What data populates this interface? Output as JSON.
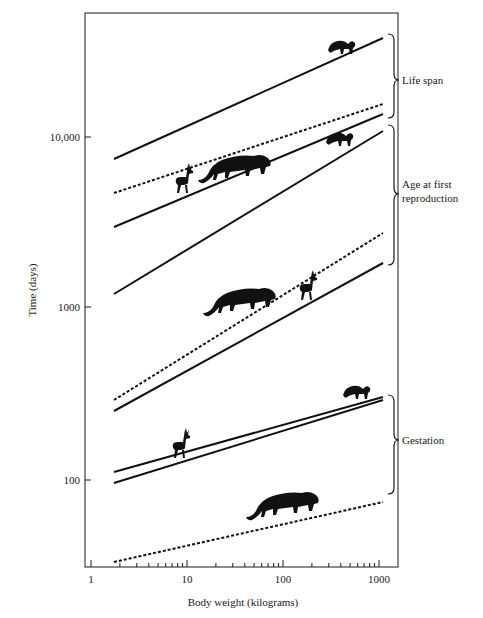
{
  "chart_data": {
    "type": "line",
    "title": "",
    "xlabel": "Body weight (kilograms)",
    "ylabel": "Time (days)",
    "xscale": "log",
    "yscale": "log",
    "xlim": [
      1,
      1300
    ],
    "ylim": [
      50,
      35000
    ],
    "x_ticks": [
      1,
      10,
      100,
      1000
    ],
    "x_tick_labels": [
      "1",
      "10",
      "100",
      "1000"
    ],
    "y_ticks": [
      100,
      1000,
      10000
    ],
    "y_tick_labels": [
      "100",
      "1000",
      "10,000"
    ],
    "grid": false,
    "legend": "none",
    "groups": [
      {
        "name": "Life span",
        "series_indices": [
          0,
          1
        ]
      },
      {
        "name": "Age at first reproduction",
        "series_indices": [
          2,
          3,
          4
        ]
      },
      {
        "name": "Gestation",
        "series_indices": [
          5,
          6,
          7
        ]
      }
    ],
    "series": [
      {
        "name": "Life span (primates)",
        "style": "solid",
        "x": [
          2.5,
          1000
        ],
        "y": [
          5500,
          28000
        ]
      },
      {
        "name": "Life span (carnivores)",
        "style": "dotted",
        "x": [
          2.5,
          1000
        ],
        "y": [
          3700,
          10500
        ]
      },
      {
        "name": "Age at first reproduction (ungulates)",
        "style": "solid",
        "x": [
          2.5,
          1000
        ],
        "y": [
          2550,
          9500
        ]
      },
      {
        "name": "Age at first reproduction (primates)",
        "style": "solid",
        "x": [
          2.5,
          1000
        ],
        "y": [
          1180,
          7900
        ]
      },
      {
        "name": "Age at first reproduction (carnivores)",
        "style": "dotted",
        "x": [
          2.5,
          1000
        ],
        "y": [
          350,
          2400
        ]
      },
      {
        "name": "Age at first reproduction (ungulates, lower)",
        "style": "solid",
        "x": [
          2.5,
          1000
        ],
        "y": [
          310,
          1650
        ]
      },
      {
        "name": "Gestation (ungulates)",
        "style": "solid",
        "x": [
          2.5,
          1000
        ],
        "y": [
          150,
          370
        ]
      },
      {
        "name": "Gestation (primates)",
        "style": "solid",
        "x": [
          2.5,
          1000
        ],
        "y": [
          133,
          360
        ]
      },
      {
        "name": "Gestation (carnivores)",
        "style": "dotted",
        "x": [
          2.5,
          1000
        ],
        "y": [
          54,
          122
        ]
      }
    ],
    "annotations": [
      "Life span",
      "Age at first reproduction",
      "Gestation"
    ],
    "icons": [
      "monkey-silhouette",
      "lion-silhouette",
      "deer-silhouette"
    ]
  },
  "labels": {
    "xlabel": "Body weight (kilograms)",
    "ylabel": "Time (days)",
    "x_ticks": [
      "1",
      "10",
      "100",
      "1000"
    ],
    "y_ticks": [
      "100",
      "1000",
      "10,000"
    ],
    "group_life_span": "Life span",
    "group_afr_line1": "Age at first",
    "group_afr_line2": "reproduction",
    "group_gestation": "Gestation"
  }
}
